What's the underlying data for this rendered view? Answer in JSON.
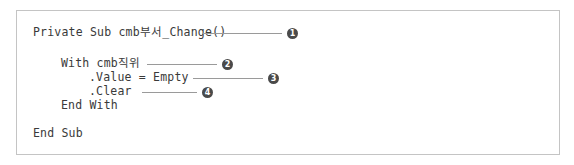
{
  "figure": {
    "type": "code-snippet-with-callouts",
    "language": "VBA",
    "border_color": "#c4c4c4",
    "background_color": "#ffffff",
    "text_color": "#3a3a3a",
    "leader_color": "#9a9a9a",
    "marker_color": "#4a4a4a",
    "marker_text_color": "#ffffff"
  },
  "code": {
    "lines": [
      {
        "text": "Private Sub cmb부서_Change()",
        "indent": 0
      },
      {
        "text": "",
        "indent": 0
      },
      {
        "text": "With cmb직위",
        "indent": 1
      },
      {
        "text": ".Value = Empty",
        "indent": 2
      },
      {
        "text": ".Clear",
        "indent": 2
      },
      {
        "text": "End With",
        "indent": 1
      },
      {
        "text": "",
        "indent": 0
      },
      {
        "text": "End Sub",
        "indent": 0
      }
    ],
    "line1": "Private Sub cmb부서_Change()",
    "line2": "With cmb직위",
    "line3": ".Value = Empty",
    "line4": ".Clear",
    "line5": "End With",
    "line6": "End Sub"
  },
  "callouts": [
    {
      "number": "1",
      "label": "callout-1",
      "target_line": "Private Sub cmb부서_Change()"
    },
    {
      "number": "2",
      "label": "callout-2",
      "target_line": "With cmb직위"
    },
    {
      "number": "3",
      "label": "callout-3",
      "target_line": ".Value = Empty"
    },
    {
      "number": "4",
      "label": "callout-4",
      "target_line": ".Clear"
    }
  ]
}
